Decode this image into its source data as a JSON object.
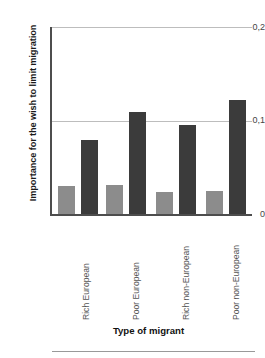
{
  "chart_data": {
    "type": "bar",
    "title": "",
    "xlabel": "Type of migrant",
    "ylabel": "Importance for the wish to limit migration",
    "categories": [
      "Rich European",
      "Poor European",
      "Rich non-European",
      "Poor non-European"
    ],
    "series": [
      {
        "name": "light-gray-series",
        "color": "#8c8c8c",
        "values": [
          0.03,
          0.031,
          0.024,
          0.025
        ]
      },
      {
        "name": "dark-gray-series",
        "color": "#3b3b3b",
        "values": [
          0.079,
          0.109,
          0.095,
          0.122
        ]
      }
    ],
    "ylim": [
      0,
      0.2
    ],
    "ytick_values": [
      0.2,
      0.1,
      0
    ],
    "ytick_labels": [
      "0,2",
      "0,1",
      "0"
    ],
    "grid": true,
    "legend": "none",
    "decimal_separator": ","
  },
  "axes": {
    "y_title": "Importance for the wish to limit migration",
    "x_title": "Type of migrant",
    "ticks": {
      "top": "0,2",
      "mid": "0,1",
      "bottom": "0"
    }
  },
  "categories": [
    {
      "label": "Rich European"
    },
    {
      "label": "Poor European"
    },
    {
      "label": "Rich non-European"
    },
    {
      "label": "Poor non-European"
    }
  ],
  "colors": {
    "light_bar": "#8c8c8c",
    "dark_bar": "#3b3b3b",
    "gridline": "#bdbdbd",
    "axis": "#4d4d4d",
    "text": "#1a1a1a"
  }
}
